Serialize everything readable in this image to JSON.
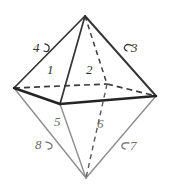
{
  "figure": {
    "name": "octahedron-face-numbering",
    "shape": "octahedron",
    "background_color": "#ffffff",
    "stroke_colors": {
      "upper_solid_edge": "#333333",
      "lower_light_edge": "#8a8a8a",
      "hidden_dashed_edge": "#3a3a3a",
      "equator_front_edge": "#2b2b2b"
    },
    "vertices": {
      "apex": {
        "label": "apex",
        "x": 85,
        "y": 16
      },
      "bottom": {
        "label": "bottom",
        "x": 86,
        "y": 178
      },
      "left": {
        "label": "left",
        "x": 14,
        "y": 88
      },
      "right": {
        "label": "right",
        "x": 156,
        "y": 96
      },
      "front": {
        "label": "front",
        "x": 60,
        "y": 104
      },
      "back": {
        "label": "back-hidden",
        "x": 107,
        "y": 84
      }
    },
    "labels": [
      {
        "id": "face-1",
        "text": "1",
        "x": 47,
        "y": 63,
        "tone": "dark",
        "hook": "none"
      },
      {
        "id": "face-2",
        "text": "2",
        "x": 86,
        "y": 63,
        "tone": "dark",
        "hook": "none"
      },
      {
        "id": "face-3",
        "text": "3",
        "x": 131,
        "y": 41,
        "tone": "dark",
        "hook": "left"
      },
      {
        "id": "face-4",
        "text": "4",
        "x": 33,
        "y": 41,
        "tone": "dark",
        "hook": "right"
      },
      {
        "id": "face-5",
        "text": "5",
        "x": 54,
        "y": 115,
        "tone": "light",
        "hook": "none"
      },
      {
        "id": "face-6",
        "text": "6",
        "x": 97,
        "y": 117,
        "tone": "light",
        "hook": "none"
      },
      {
        "id": "face-7",
        "text": "7",
        "x": 126,
        "y": 139,
        "tone": "light",
        "hook": "left"
      },
      {
        "id": "face-8",
        "text": "8",
        "x": 35,
        "y": 138,
        "tone": "light",
        "hook": "right"
      }
    ]
  }
}
